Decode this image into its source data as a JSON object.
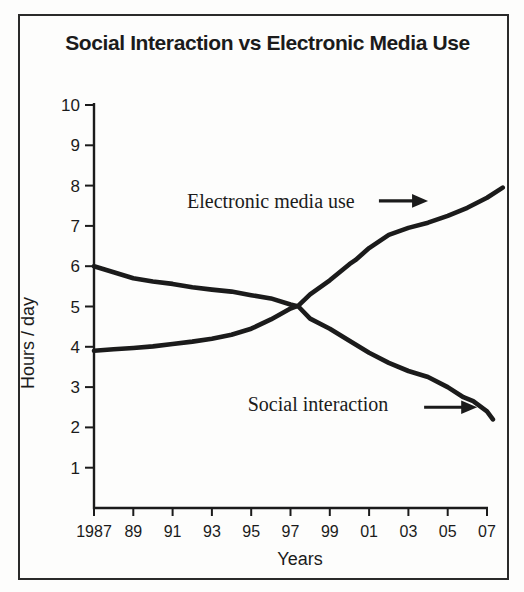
{
  "figure": {
    "title": "Social Interaction vs Electronic Media Use"
  },
  "chart_data": {
    "type": "line",
    "title": "Social Interaction vs Electronic Media Use",
    "xlabel": "Years",
    "ylabel": "Hours / day",
    "x_range": [
      1987,
      2008
    ],
    "y_range": [
      0,
      10
    ],
    "grid": false,
    "legend": "inline-annotations",
    "x_ticks": [
      {
        "year": 1987,
        "label": "1987"
      },
      {
        "year": 1989,
        "label": "89"
      },
      {
        "year": 1991,
        "label": "91"
      },
      {
        "year": 1993,
        "label": "93"
      },
      {
        "year": 1995,
        "label": "95"
      },
      {
        "year": 1997,
        "label": "97"
      },
      {
        "year": 1999,
        "label": "99"
      },
      {
        "year": 2001,
        "label": "01"
      },
      {
        "year": 2003,
        "label": "03"
      },
      {
        "year": 2005,
        "label": "05"
      },
      {
        "year": 2007,
        "label": "07"
      }
    ],
    "y_ticks": [
      1,
      2,
      3,
      4,
      5,
      6,
      7,
      8,
      9,
      10
    ],
    "series": [
      {
        "name": "Social interaction",
        "points": [
          [
            1987,
            6.0
          ],
          [
            1988,
            5.85
          ],
          [
            1989,
            5.7
          ],
          [
            1990,
            5.62
          ],
          [
            1991,
            5.56
          ],
          [
            1992,
            5.48
          ],
          [
            1993,
            5.42
          ],
          [
            1994,
            5.37
          ],
          [
            1995,
            5.28
          ],
          [
            1996,
            5.2
          ],
          [
            1997,
            5.05
          ],
          [
            1997.4,
            5.0
          ],
          [
            1998,
            4.7
          ],
          [
            1999,
            4.45
          ],
          [
            2000,
            4.15
          ],
          [
            2001,
            3.85
          ],
          [
            2002,
            3.6
          ],
          [
            2003,
            3.4
          ],
          [
            2004,
            3.25
          ],
          [
            2005,
            3.0
          ],
          [
            2005.8,
            2.75
          ],
          [
            2006.3,
            2.65
          ],
          [
            2007,
            2.4
          ],
          [
            2007.3,
            2.2
          ]
        ]
      },
      {
        "name": "Electronic media use",
        "points": [
          [
            1987,
            3.9
          ],
          [
            1988,
            3.94
          ],
          [
            1989,
            3.97
          ],
          [
            1990,
            4.01
          ],
          [
            1991,
            4.07
          ],
          [
            1992,
            4.13
          ],
          [
            1993,
            4.2
          ],
          [
            1994,
            4.3
          ],
          [
            1995,
            4.45
          ],
          [
            1996,
            4.68
          ],
          [
            1997,
            4.95
          ],
          [
            1997.4,
            5.02
          ],
          [
            1998,
            5.3
          ],
          [
            1999,
            5.65
          ],
          [
            2000,
            6.05
          ],
          [
            2000.3,
            6.15
          ],
          [
            2001,
            6.45
          ],
          [
            2002,
            6.78
          ],
          [
            2003,
            6.95
          ],
          [
            2004,
            7.08
          ],
          [
            2005,
            7.25
          ],
          [
            2006,
            7.45
          ],
          [
            2007,
            7.7
          ],
          [
            2007.8,
            7.95
          ]
        ]
      }
    ],
    "annotations": [
      {
        "text": "Electronic media use",
        "text_pos": [
          1996,
          7.62
        ],
        "arrow_from": [
          2001.5,
          7.62
        ],
        "arrow_to": [
          2004,
          7.62
        ]
      },
      {
        "text": "Social interaction",
        "text_pos": [
          1998.4,
          2.58
        ],
        "arrow_from": [
          2003.8,
          2.5
        ],
        "arrow_to": [
          2006.5,
          2.5
        ]
      }
    ]
  },
  "colors": {
    "ink": "#1b1b1b",
    "background": "#fdfdfc",
    "frame_border": "#2a2a2a"
  }
}
